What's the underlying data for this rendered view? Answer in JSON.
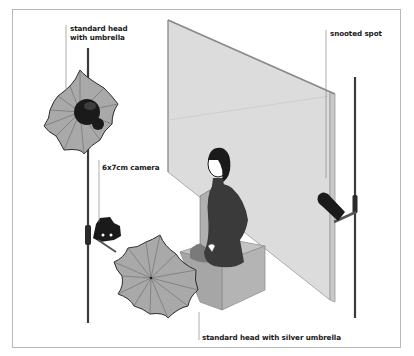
{
  "diagram": {
    "type": "studio-lighting-setup",
    "labels": {
      "top_left_head_line1": "standard head",
      "top_left_head_line2": "with umbrella",
      "camera": "6x7cm camera",
      "snooted_spot": "snooted spot",
      "bottom_umbrella": "standard head with silver umbrella"
    },
    "elements": [
      {
        "name": "background-wall",
        "description": "grey flat panel backdrop"
      },
      {
        "name": "subject",
        "description": "seated person on box facing wall"
      },
      {
        "name": "posing-box",
        "description": "grey cube seat"
      },
      {
        "name": "umbrella-light-top",
        "description": "standard head with umbrella on stand"
      },
      {
        "name": "camera",
        "description": "6x7cm camera on stand"
      },
      {
        "name": "umbrella-light-bottom",
        "description": "standard head with silver umbrella"
      },
      {
        "name": "snooted-spot",
        "description": "snooted spot light on stand"
      }
    ],
    "colors": {
      "frame_border": "#b8b8b8",
      "wall": "#dcdcdc",
      "umbrella": "#a9a9a9",
      "dark": "#1a1a1a",
      "box": "#b4b4b4"
    }
  }
}
